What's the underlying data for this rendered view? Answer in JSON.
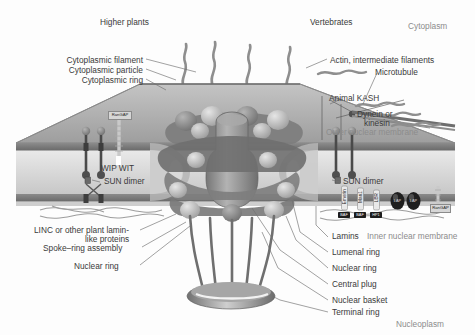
{
  "figure": {
    "background": "#fdfdfd",
    "palette": {
      "cytoplasm_membrane": "#9a9a9a",
      "lumen": "#c9c9c9",
      "npc_dark": "#6e6e6e",
      "npc_mid": "#8f8f8f",
      "npc_light": "#b9b9b9",
      "label_text": "#3a3a3a",
      "faint_text": "#8c8c8c",
      "leader_line": "#6f6f6f",
      "black_tag": "#1d1d1d"
    }
  },
  "headers": {
    "left_organism": "Higher plants",
    "right_organism": "Vertebrates",
    "top_compartment": "Cytoplasm",
    "bottom_compartment": "Nucleoplasm"
  },
  "left_labels": [
    {
      "text": "Cytoplasmic filament",
      "x": 24,
      "y": 56
    },
    {
      "text": "Cytoplasmic particle",
      "x": 30,
      "y": 66
    },
    {
      "text": "Cytoplasmic ring",
      "x": 47,
      "y": 76
    }
  ],
  "left_lower_labels": [
    {
      "text": "LINC or other plant lamin-",
      "x": 34,
      "y": 226
    },
    {
      "text": "like proteins",
      "x": 85,
      "y": 235
    },
    {
      "text": "Spoke–ring assembly",
      "x": 43,
      "y": 244
    },
    {
      "text": "Nuclear ring",
      "x": 74,
      "y": 262
    }
  ],
  "right_labels": [
    {
      "text": "Actin, intermediate filaments",
      "x": 330,
      "y": 57
    },
    {
      "text": "Microtubule",
      "x": 378,
      "y": 70
    },
    {
      "text": "Animal KASH",
      "x": 330,
      "y": 96
    },
    {
      "text": "Dynein or",
      "x": 358,
      "y": 112
    },
    {
      "text": "kinesin",
      "x": 364,
      "y": 121
    },
    {
      "text": "Outer nuclear membrane",
      "x": 327,
      "y": 130
    }
  ],
  "right_lower_labels": [
    {
      "text": "Lamins",
      "x": 330,
      "y": 235
    },
    {
      "text": "Inner nuclear membrane",
      "x": 367,
      "y": 235
    },
    {
      "text": "Lumenal ring",
      "x": 330,
      "y": 250
    },
    {
      "text": "Nuclear ring",
      "x": 330,
      "y": 266
    },
    {
      "text": "Central plug",
      "x": 330,
      "y": 282
    },
    {
      "text": "Nuclear basket",
      "x": 330,
      "y": 299
    },
    {
      "text": "Terminal ring",
      "x": 330,
      "y": 311
    }
  ],
  "inline_labels": [
    {
      "text": "WIP  WIT",
      "x": 101,
      "y": 166
    },
    {
      "text": "SUN dimer",
      "x": 104,
      "y": 179
    },
    {
      "text": "SUN dimer",
      "x": 343,
      "y": 179
    }
  ],
  "tag_boxes": [
    {
      "text": "RanGAP",
      "x": 108,
      "y": 111,
      "w": 22,
      "style": "grey"
    },
    {
      "text": "RanGAP",
      "x": 430,
      "y": 205,
      "w": 19,
      "style": "grey"
    }
  ],
  "membrane_proteins_vertical": [
    {
      "text": "Emerin",
      "x": 344,
      "y": 190
    },
    {
      "text": "Man1",
      "x": 360,
      "y": 192
    },
    {
      "text": "LBR",
      "x": 375,
      "y": 194
    }
  ],
  "membrane_protein_tags": [
    {
      "text": "BAF",
      "x": 339,
      "y": 213,
      "w": 11
    },
    {
      "text": "BAF",
      "x": 355,
      "y": 213,
      "w": 11
    },
    {
      "text": "HP1",
      "x": 371,
      "y": 213,
      "w": 11
    },
    {
      "text": "LAP",
      "x": 392,
      "y": 196,
      "w": 11
    },
    {
      "text": "LAP",
      "x": 408,
      "y": 196,
      "w": 11
    }
  ]
}
